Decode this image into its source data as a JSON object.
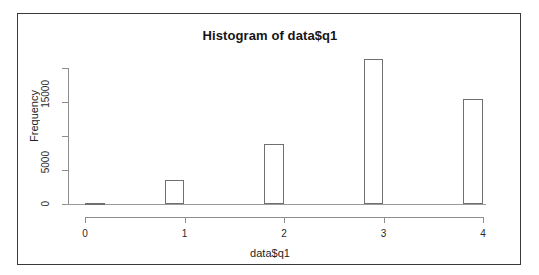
{
  "chart_data": {
    "type": "bar",
    "title": "Histogram of data$q1",
    "xlabel": "data$q1",
    "ylabel": "Frequency",
    "grid": false,
    "legend": null,
    "bin_edges": [
      0,
      0.8,
      1.8,
      2.8,
      3.8,
      4.0
    ],
    "bins": [
      {
        "label": "0",
        "x_left": 0.0,
        "x_right": 0.2,
        "value": 150
      },
      {
        "label": "1",
        "x_left": 0.8,
        "x_right": 1.0,
        "value": 3500
      },
      {
        "label": "2",
        "x_left": 1.8,
        "x_right": 2.0,
        "value": 8800
      },
      {
        "label": "3",
        "x_left": 2.8,
        "x_right": 3.0,
        "value": 21300
      },
      {
        "label": "4",
        "x_left": 3.8,
        "x_right": 4.0,
        "value": 15400
      }
    ],
    "categories": [
      "0",
      "1",
      "2",
      "3",
      "4"
    ],
    "values": [
      150,
      3500,
      8800,
      21300,
      15400
    ],
    "xlim": [
      0,
      4
    ],
    "ylim": [
      0,
      21800
    ],
    "xticks": [
      "0",
      "1",
      "2",
      "3",
      "4"
    ],
    "xtick_values": [
      0,
      1,
      2,
      3,
      4
    ],
    "yticks": [
      "0",
      "5000",
      "15000"
    ],
    "ytick_values": [
      0,
      5000,
      15000
    ],
    "ytick_values_all": [
      0,
      5000,
      10000,
      15000,
      20000
    ],
    "colors": {
      "bar_border": "#6f6f6f",
      "bar_fill": "#ffffff",
      "axis": "#8d8d8d",
      "text": "#1d1d1d",
      "frame": "#3a3a3a",
      "background": "#ffffff"
    }
  }
}
